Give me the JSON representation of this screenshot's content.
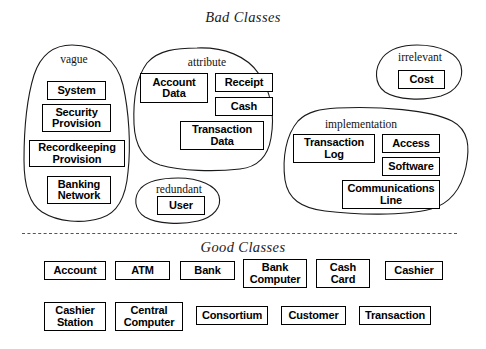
{
  "diagram": {
    "bad_section": {
      "title": "Bad Classes",
      "groups": [
        {
          "label": "vague",
          "items": [
            "System",
            "Security\nProvision",
            "Recordkeeping\nProvision",
            "Banking\nNetwork"
          ]
        },
        {
          "label": "attribute",
          "items": [
            "Account\nData",
            "Receipt",
            "Cash",
            "Transaction\nData"
          ]
        },
        {
          "label": "redundant",
          "items": [
            "User"
          ]
        },
        {
          "label": "irrelevant",
          "items": [
            "Cost"
          ]
        },
        {
          "label": "implementation",
          "items": [
            "Transaction\nLog",
            "Access",
            "Software",
            "Communications\nLine"
          ]
        }
      ]
    },
    "good_section": {
      "title": "Good Classes",
      "row1": [
        "Account",
        "ATM",
        "Bank",
        "Bank\nComputer",
        "Cash\nCard",
        "Cashier"
      ],
      "row2": [
        "Cashier\nStation",
        "Central\nComputer",
        "Consortium",
        "Customer",
        "Transaction"
      ]
    },
    "colors": {
      "ink": "#000000",
      "outline": "#1a1a1a",
      "divider": "#555555",
      "background": "#ffffff"
    }
  }
}
